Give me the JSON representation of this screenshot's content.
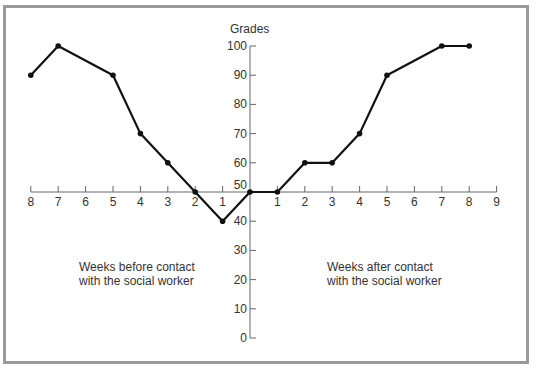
{
  "chart_data": {
    "type": "line",
    "title": "",
    "ylabel": "Grades",
    "xlabel": "",
    "ylim": [
      0,
      100
    ],
    "y_ticks": [
      "0",
      "10",
      "20",
      "30",
      "40",
      "50",
      "60",
      "70",
      "80",
      "90",
      "100"
    ],
    "x_ticks_before": [
      "8",
      "7",
      "6",
      "5",
      "4",
      "3",
      "2",
      "1"
    ],
    "x_ticks_after": [
      "1",
      "2",
      "3",
      "4",
      "5",
      "6",
      "7",
      "8",
      "9"
    ],
    "x_axis_crosses_y_at": 50,
    "grid": false,
    "legend": null,
    "annotations": [
      "Weeks before contact\nwith the social worker",
      "Weeks after contact\nwith the social worker"
    ],
    "series": [
      {
        "name": "Grades",
        "points": [
          {
            "x": -8,
            "y": 90
          },
          {
            "x": -7,
            "y": 100
          },
          {
            "x": -5,
            "y": 90
          },
          {
            "x": -4,
            "y": 70
          },
          {
            "x": -3,
            "y": 60
          },
          {
            "x": -2,
            "y": 50
          },
          {
            "x": -1,
            "y": 40
          },
          {
            "x": 0,
            "y": 50
          },
          {
            "x": 1,
            "y": 50
          },
          {
            "x": 2,
            "y": 60
          },
          {
            "x": 3,
            "y": 60
          },
          {
            "x": 4,
            "y": 70
          },
          {
            "x": 5,
            "y": 90
          },
          {
            "x": 7,
            "y": 100
          },
          {
            "x": 8,
            "y": 100
          }
        ]
      }
    ]
  },
  "labels": {
    "y_axis_title": "Grades",
    "before_note": "Weeks before contact\nwith the social worker",
    "after_note": "Weeks after contact\nwith the social worker"
  }
}
